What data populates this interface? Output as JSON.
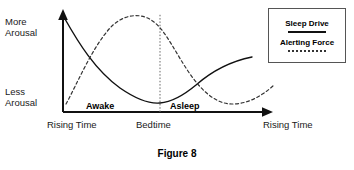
{
  "figure": {
    "caption": "Figure 8",
    "axes": {
      "y_top_label": "More\nArousal",
      "y_top_label_line1": "More",
      "y_top_label_line2": "Arousal",
      "y_bottom_label_line1": "Less",
      "y_bottom_label_line2": "Arousal",
      "x_tick_left": "Rising Time",
      "x_tick_mid": "Bedtime",
      "x_tick_right": "Rising Time"
    },
    "phases": {
      "awake": "Awake",
      "asleep": "Asleep"
    },
    "legend": {
      "items": [
        {
          "label": "Sleep Drive",
          "style": "solid"
        },
        {
          "label": "Alerting Force",
          "style": "dashed"
        }
      ]
    }
  },
  "chart_data": {
    "type": "line",
    "title": "Figure 8",
    "xlabel": "",
    "ylabel": "Arousal",
    "grid": false,
    "legend_position": "top-right",
    "xlim": [
      0,
      100
    ],
    "ylim": [
      0,
      100
    ],
    "x_tick_labels": [
      "Rising Time",
      "Bedtime",
      "Rising Time"
    ],
    "x_tick_positions": [
      0,
      47,
      100
    ],
    "y_tick_labels": [
      "Less Arousal",
      "More Arousal"
    ],
    "annotations": [
      "Awake",
      "Asleep"
    ],
    "series": [
      {
        "name": "Sleep Drive",
        "style": "solid",
        "color": "#111111",
        "x": [
          0,
          10,
          20,
          30,
          40,
          47,
          55,
          65,
          75,
          85,
          95,
          100
        ],
        "y": [
          92,
          78,
          62,
          44,
          26,
          8,
          22,
          42,
          58,
          68,
          74,
          77
        ]
      },
      {
        "name": "Alerting Force",
        "style": "dashed",
        "color": "#333333",
        "x": [
          0,
          8,
          18,
          28,
          38,
          47,
          57,
          67,
          77,
          85,
          92,
          100
        ],
        "y": [
          8,
          40,
          72,
          90,
          94,
          78,
          56,
          32,
          14,
          8,
          12,
          26
        ]
      }
    ],
    "vertical_markers": [
      {
        "label": "Bedtime",
        "x": 47,
        "style": "dotted"
      }
    ]
  },
  "colors": {
    "background": "#ffffff",
    "axis": "#111111",
    "sleep_drive": "#111111",
    "alerting_force": "#333333",
    "legend_border": "#555555",
    "text": "#1a1a1a"
  }
}
